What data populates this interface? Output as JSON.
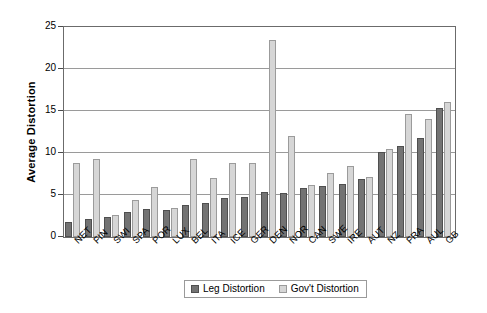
{
  "chart_data": {
    "type": "bar",
    "title": "",
    "xlabel": "",
    "ylabel": "Average Distortion",
    "ylim": [
      0,
      25
    ],
    "yticks": [
      0,
      5,
      10,
      15,
      20,
      25
    ],
    "grid": true,
    "legend_position": "bottom-center",
    "categories": [
      "NET",
      "FIN",
      "SWI",
      "SPA",
      "POR",
      "LUX",
      "BEL",
      "ITA",
      "ICE",
      "GER",
      "DEN",
      "NOR",
      "CAN",
      "SWE",
      "IRE",
      "AUT",
      "NZ",
      "FRA",
      "AUL",
      "GB"
    ],
    "series": [
      {
        "name": "Leg Distortion",
        "color": "#737373",
        "values": [
          1.8,
          2.2,
          2.4,
          3.0,
          3.3,
          3.2,
          3.8,
          4.0,
          4.6,
          4.8,
          5.3,
          5.2,
          5.8,
          6.1,
          6.3,
          6.9,
          10.1,
          10.8,
          11.8,
          15.3
        ]
      },
      {
        "name": "Gov't Distortion",
        "color": "#d6d6d6",
        "values": [
          8.8,
          9.3,
          2.6,
          4.4,
          6.0,
          3.5,
          9.3,
          7.0,
          8.8,
          8.8,
          23.4,
          12.0,
          6.2,
          7.6,
          8.4,
          7.2,
          10.5,
          14.7,
          14.1,
          16.1
        ]
      }
    ]
  },
  "axis": {
    "y_title": "Average Distortion"
  },
  "legend": {
    "items": [
      {
        "label": "Leg Distortion"
      },
      {
        "label": "Gov't Distortion"
      }
    ]
  }
}
